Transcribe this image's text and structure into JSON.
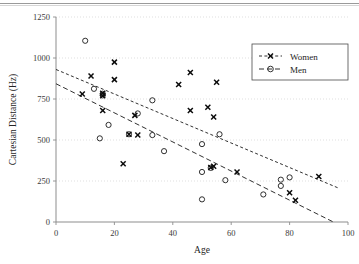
{
  "figure": {
    "has_top_rule": true
  },
  "chart_data": {
    "type": "scatter",
    "title": "",
    "xlabel": "Age",
    "ylabel": "Cartesian Distance (Hz)",
    "xlim": [
      0,
      100
    ],
    "ylim": [
      0,
      1250
    ],
    "xticks": [
      0,
      20,
      40,
      60,
      80,
      100
    ],
    "yticks": [
      0,
      250,
      500,
      750,
      1000,
      1250
    ],
    "xticklabels": [
      "0",
      "20",
      "40",
      "60",
      "80",
      "100"
    ],
    "yticklabels": [
      "0",
      "250",
      "500",
      "750",
      "1000",
      "1250"
    ],
    "grid": "horizontal-dotted",
    "legend_position": "upper-right",
    "series": [
      {
        "name": "Women",
        "marker": "x-bold",
        "line_style": "dotted",
        "points": [
          [
            9,
            780
          ],
          [
            12,
            890
          ],
          [
            16,
            785
          ],
          [
            16,
            770
          ],
          [
            16,
            680
          ],
          [
            20,
            975
          ],
          [
            20,
            868
          ],
          [
            23,
            355
          ],
          [
            25,
            535
          ],
          [
            27,
            650
          ],
          [
            28,
            530
          ],
          [
            42,
            838
          ],
          [
            46,
            912
          ],
          [
            46,
            680
          ],
          [
            52,
            700
          ],
          [
            54,
            640
          ],
          [
            55,
            852
          ],
          [
            54,
            340
          ],
          [
            53,
            332
          ],
          [
            62,
            305
          ],
          [
            80,
            178
          ],
          [
            82,
            133
          ],
          [
            90,
            278
          ]
        ],
        "trend_line": {
          "x0": 0,
          "y0": 930,
          "x1": 97,
          "y1": 205
        }
      },
      {
        "name": "Men",
        "marker": "circle-open",
        "line_style": "dashed",
        "points": [
          [
            10,
            1105
          ],
          [
            13,
            812
          ],
          [
            15,
            510
          ],
          [
            16,
            782
          ],
          [
            16,
            772
          ],
          [
            18,
            592
          ],
          [
            25,
            535
          ],
          [
            28,
            662
          ],
          [
            33,
            742
          ],
          [
            33,
            530
          ],
          [
            37,
            432
          ],
          [
            50,
            475
          ],
          [
            50,
            305
          ],
          [
            50,
            138
          ],
          [
            53,
            330
          ],
          [
            56,
            535
          ],
          [
            58,
            255
          ],
          [
            71,
            168
          ],
          [
            77,
            258
          ],
          [
            77,
            220
          ],
          [
            80,
            272
          ]
        ],
        "trend_line": {
          "x0": 0,
          "y0": 843,
          "x1": 95,
          "y1": 0
        }
      }
    ]
  }
}
